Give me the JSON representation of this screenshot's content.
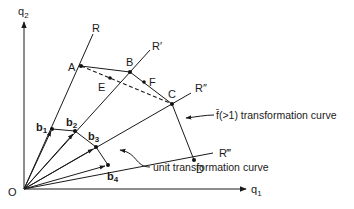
{
  "axes": {
    "y_label": "q",
    "y_sub": "2",
    "x_label": "q",
    "x_sub": "1",
    "origin_label": "O"
  },
  "rays": [
    {
      "name": "R",
      "label": "R"
    },
    {
      "name": "R-prime",
      "label": "R′"
    },
    {
      "name": "R-double-prime",
      "label": "R″"
    },
    {
      "name": "R-triple-prime",
      "label": "R‴"
    }
  ],
  "points": {
    "A": "A",
    "B": "B",
    "C": "C",
    "D": "D",
    "E": "E",
    "F": "F"
  },
  "unit_points": [
    {
      "main": "b",
      "sub": "1"
    },
    {
      "main": "b",
      "sub": "2"
    },
    {
      "main": "b",
      "sub": "3"
    },
    {
      "main": "b",
      "sub": "4"
    }
  ],
  "annotations": {
    "upper_curve": "f̄(>1) transformation curve",
    "unit_curve": "unit transformation curve"
  },
  "colors": {
    "ink": "#1a1a1a",
    "background": "#ffffff"
  }
}
